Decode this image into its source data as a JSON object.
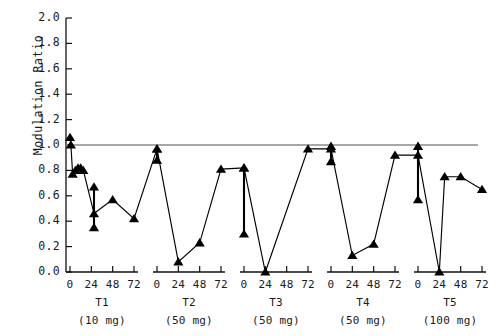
{
  "axes": {
    "ylabel": "Modulation Ratio",
    "yticks": [
      "0.0",
      "0.2",
      "0.4",
      "0.6",
      "0.8",
      "1.0",
      "1.2",
      "1.4",
      "1.6",
      "1.8",
      "2.0"
    ],
    "ylim": [
      0.0,
      2.0
    ],
    "xticks": [
      "0",
      "24",
      "48",
      "72"
    ],
    "xlim_hours": [
      0,
      78
    ],
    "reference_line_value": "1.0",
    "reference_line_color": "#8a8a8a",
    "marker_color": "#000000",
    "line_color": "#000000"
  },
  "groups": [
    {
      "id": "t1",
      "name": "T1",
      "dose": "(10 mg)"
    },
    {
      "id": "t2",
      "name": "T2",
      "dose": "(50 mg)"
    },
    {
      "id": "t3",
      "name": "T3",
      "dose": "(50 mg)"
    },
    {
      "id": "t4",
      "name": "T4",
      "dose": "(50 mg)"
    },
    {
      "id": "t5",
      "name": "T5",
      "dose": "(100 mg)"
    }
  ],
  "chart_data": {
    "type": "line",
    "title": "",
    "xlabel": "",
    "ylabel": "Modulation Ratio",
    "ylim": [
      0.0,
      2.0
    ],
    "grid": false,
    "legend": "none",
    "reference_line": {
      "y": 1.0,
      "color": "#8a8a8a",
      "style": "solid"
    },
    "marker": "triangle-up",
    "xtick_labels": [
      "0",
      "24",
      "48",
      "72"
    ],
    "panels": [
      {
        "name": "T1",
        "dose_mg": 10,
        "dose_label": "(10 mg)",
        "x": [
          0,
          1,
          3,
          6,
          9,
          12,
          15,
          27,
          48,
          72
        ],
        "y": [
          1.06,
          1.0,
          0.77,
          0.8,
          0.82,
          0.82,
          0.8,
          0.46,
          0.57,
          0.42
        ],
        "errors": [
          {
            "x": 27,
            "low": 0.35,
            "high": 0.67
          }
        ]
      },
      {
        "name": "T2",
        "dose_mg": 50,
        "dose_label": "(50 mg)",
        "x": [
          0,
          24,
          48,
          72
        ],
        "y": [
          0.97,
          0.08,
          0.23,
          0.81
        ],
        "errors": [
          {
            "x": 0,
            "low": 0.88,
            "high": 0.97
          }
        ]
      },
      {
        "name": "T3",
        "dose_mg": 50,
        "dose_label": "(50 mg)",
        "x": [
          0,
          24,
          72
        ],
        "y": [
          0.82,
          0.0,
          0.97
        ],
        "errors": [
          {
            "x": 0,
            "low": 0.3,
            "high": 0.82
          }
        ]
      },
      {
        "name": "T4",
        "dose_mg": 50,
        "dose_label": "(50 mg)",
        "x": [
          0,
          24,
          48,
          72
        ],
        "y": [
          0.97,
          0.13,
          0.22,
          0.92
        ],
        "errors": [
          {
            "x": 0,
            "low": 0.87,
            "high": 0.99
          }
        ]
      },
      {
        "name": "T5",
        "dose_mg": 100,
        "dose_label": "(100 mg)",
        "x": [
          0,
          24,
          30,
          48,
          72
        ],
        "y": [
          0.92,
          0.0,
          0.75,
          0.75,
          0.65
        ],
        "errors": [
          {
            "x": 0,
            "low": 0.57,
            "high": 0.99
          }
        ]
      }
    ]
  }
}
